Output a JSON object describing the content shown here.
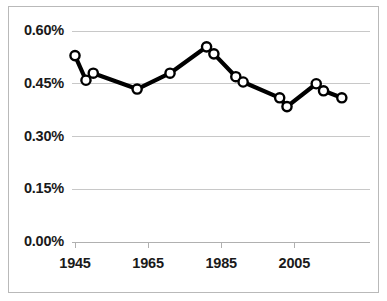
{
  "chart_data": {
    "type": "line",
    "title": "",
    "subtitle": "",
    "xlabel": "",
    "ylabel": "",
    "xlim": [
      1943,
      2020
    ],
    "ylim": [
      0.0,
      0.6
    ],
    "grid": true,
    "gridlines_horizontal": [
      0.0,
      0.15,
      0.3,
      0.45,
      0.6
    ],
    "legend": null,
    "legend_position": "none",
    "marker": "open-circle",
    "line_color": "#000000",
    "marker_face_color": "#ffffff",
    "marker_edge_color": "#000000",
    "grid_color": "#c8c8c8",
    "y_tick_labels": [
      "0.00%",
      "0.15%",
      "0.30%",
      "0.45%",
      "0.60%"
    ],
    "y_tick_values": [
      0.0,
      0.15,
      0.3,
      0.45,
      0.6
    ],
    "x_tick_labels": [
      "1945",
      "1965",
      "1985",
      "2005"
    ],
    "x_tick_values": [
      1945,
      1965,
      1985,
      2005
    ],
    "x": [
      1945,
      1948,
      1950,
      1962,
      1971,
      1981,
      1983,
      1989,
      1991,
      2001,
      2003,
      2011,
      2013,
      2018
    ],
    "values": [
      0.53,
      0.46,
      0.48,
      0.435,
      0.48,
      0.555,
      0.535,
      0.47,
      0.455,
      0.41,
      0.385,
      0.45,
      0.43,
      0.41
    ],
    "series": [
      {
        "name": "series-1",
        "x": [
          1945,
          1948,
          1950,
          1962,
          1971,
          1981,
          1983,
          1989,
          1991,
          2001,
          2003,
          2011,
          2013,
          2018
        ],
        "values": [
          0.53,
          0.46,
          0.48,
          0.435,
          0.48,
          0.555,
          0.535,
          0.47,
          0.455,
          0.41,
          0.385,
          0.45,
          0.43,
          0.41
        ]
      }
    ],
    "annotations": []
  }
}
